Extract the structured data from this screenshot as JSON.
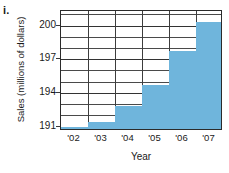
{
  "figure": {
    "item_label": "i."
  },
  "chart_data": {
    "type": "bar",
    "title": "",
    "xlabel": "Year",
    "ylabel": "Sales (millions of dollars)",
    "categories": [
      "'02",
      "'03",
      "'04",
      "'05",
      "'06",
      "'07"
    ],
    "values": [
      191.0,
      191.4,
      192.8,
      194.7,
      197.7,
      200.3
    ],
    "ylim": [
      190.6,
      201.3
    ],
    "xlim": [
      0,
      6
    ],
    "ytick_labels": [
      "191",
      "194",
      "197",
      "200"
    ],
    "ytick_values": [
      191,
      194,
      197,
      200
    ],
    "gridline_values": [
      191,
      192,
      193,
      194,
      195,
      196,
      197,
      198,
      199,
      200,
      201
    ],
    "grid": true,
    "legend": null,
    "bar_color": "#6fb5dc",
    "axis_color": "#2b2b2b",
    "grid_color": "#4a4a4a",
    "background": "#ffffff"
  }
}
